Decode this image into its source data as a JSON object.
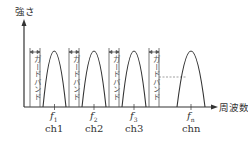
{
  "diagram": {
    "y_axis_label": "強さ",
    "x_axis_label": "周波数",
    "guard_band_label": "ガードバンド",
    "channels": [
      {
        "freq": "f",
        "freq_sub": "1",
        "name": "ch1"
      },
      {
        "freq": "f",
        "freq_sub": "2",
        "name": "ch2"
      },
      {
        "freq": "f",
        "freq_sub": "3",
        "name": "ch3"
      },
      {
        "freq": "f",
        "freq_sub": "n",
        "name": "chn"
      }
    ],
    "guard_bands": [
      {
        "label": "ガードバンド"
      },
      {
        "label": "ガードバンド"
      },
      {
        "label": "ガードバンド"
      },
      {
        "label": "ガードバンド"
      }
    ],
    "colors": {
      "line": "#333333",
      "guard_line": "#555555",
      "dashed": "#777777"
    }
  }
}
